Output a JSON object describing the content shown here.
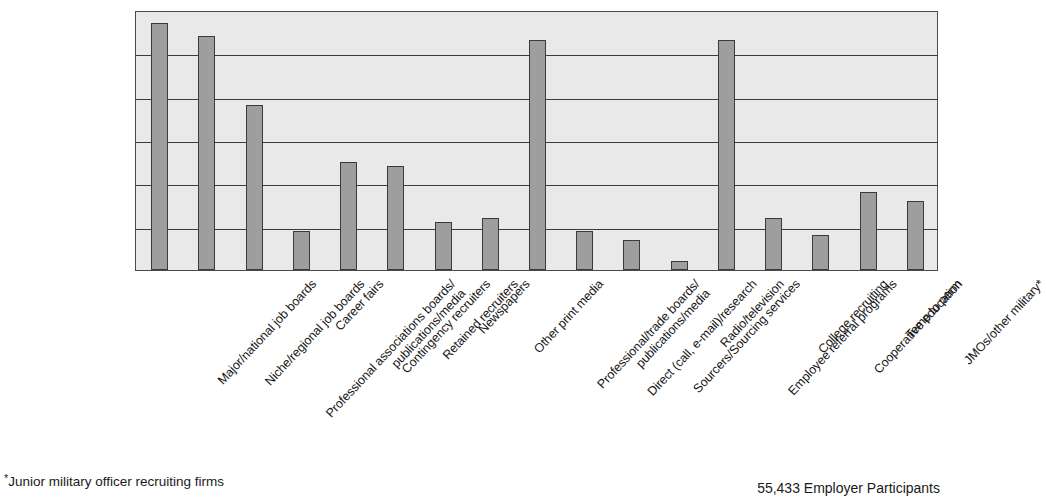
{
  "chart_data": {
    "type": "bar",
    "title": "",
    "subtitle": "",
    "xlabel": "",
    "ylabel": "",
    "ylim": [
      0,
      60
    ],
    "grid": true,
    "gridlines": [
      10,
      20,
      30,
      40,
      50
    ],
    "legend": "none",
    "orientation": "vertical",
    "bar_color": "#9e9e9e",
    "bar_edge_color": "#3a3a3a",
    "plot_background": "#e9e9e9",
    "categories": [
      "Major/national job boards",
      "Niche/regional job boards",
      "Professional associations boards/ publications/media",
      "Career fairs",
      "Contingency recruiters",
      "Retained recruiters",
      "Newspapers",
      "Other print media",
      "Professional/trade boards/ publications/media",
      "Direct (call, e-mail)/research",
      "Sourcers/Sourcing services",
      "Radio/television",
      "Employee referral programs",
      "College recruiting",
      "Cooperative education",
      "Temp to perm",
      "JMOs/other military*"
    ],
    "category_lines": [
      [
        "Major/national job boards"
      ],
      [
        "Niche/regional job boards"
      ],
      [
        "Professional associations boards/",
        "publications/media"
      ],
      [
        "Career fairs"
      ],
      [
        "Contingency recruiters"
      ],
      [
        "Retained recruiters"
      ],
      [
        "Newspapers"
      ],
      [
        "Other print media"
      ],
      [
        "Professional/trade boards/",
        "publications/media"
      ],
      [
        "Direct (call, e-mail)/research"
      ],
      [
        "Sourcers/Sourcing services"
      ],
      [
        "Radio/television"
      ],
      [
        "Employee referral programs"
      ],
      [
        "College recruiting"
      ],
      [
        "Cooperative education"
      ],
      [
        "Temp to perm"
      ],
      [
        "JMOs/other military*"
      ]
    ],
    "values": [
      57,
      54,
      38,
      9,
      25,
      24,
      11,
      12,
      53,
      9,
      7,
      2,
      53,
      12,
      8,
      18,
      16
    ]
  },
  "footnotes": {
    "left_marker": "*",
    "left": "Junior military officer recruiting firms",
    "right": "55,433 Employer Participants"
  }
}
